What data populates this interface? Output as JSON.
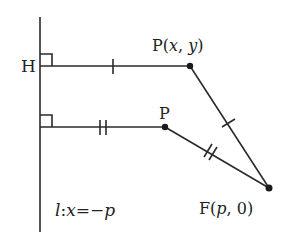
{
  "diagram": {
    "type": "parabola-definition",
    "directrix_label": "l:x=−p",
    "directrix_parts": {
      "name": "l",
      "sep": ":",
      "var": "x",
      "eq": "=−",
      "val": "p"
    },
    "foot_label": "H",
    "point_general_label": "P(x, y)",
    "point_general_parts": {
      "name": "P(",
      "x": "x",
      "comma": ", ",
      "y": "y",
      "close": ")"
    },
    "point_label": "P",
    "focus_label": "F(p, 0)",
    "focus_parts": {
      "name": "F(",
      "p": "p",
      "rest": ", 0)"
    },
    "tick_marks": {
      "upper_pair": "single",
      "lower_pair": "double"
    },
    "colors": {
      "stroke": "#2a2a2a",
      "background": "#ffffff"
    }
  }
}
